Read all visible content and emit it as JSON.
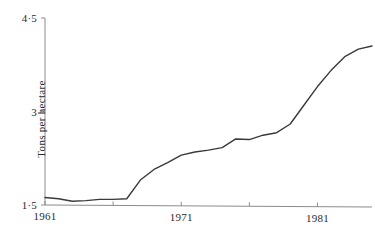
{
  "chart_data": {
    "type": "line",
    "title": "",
    "xlabel": "",
    "ylabel": "Tons per hectare",
    "xlim": [
      1961,
      1985
    ],
    "ylim": [
      1.5,
      4.5
    ],
    "grid": false,
    "legend": null,
    "y_ticks": [
      {
        "value": 4.5,
        "label": "4·5"
      },
      {
        "value": 3.0,
        "label": "3"
      },
      {
        "value": 1.5,
        "label": "1·5"
      }
    ],
    "x_ticks": [
      {
        "value": 1961,
        "label": "1961"
      },
      {
        "value": 1966,
        "label": ""
      },
      {
        "value": 1971,
        "label": "1971"
      },
      {
        "value": 1976,
        "label": ""
      },
      {
        "value": 1981,
        "label": "1981"
      }
    ],
    "series": [
      {
        "name": "Yield",
        "color": "#3a3a3a",
        "x": [
          1961,
          1962,
          1963,
          1964,
          1965,
          1966,
          1967,
          1968,
          1969,
          1970,
          1971,
          1972,
          1973,
          1974,
          1975,
          1976,
          1977,
          1978,
          1979,
          1980,
          1981,
          1982,
          1983,
          1984,
          1985
        ],
        "values": [
          1.62,
          1.6,
          1.56,
          1.57,
          1.59,
          1.59,
          1.6,
          1.9,
          2.07,
          2.18,
          2.3,
          2.35,
          2.38,
          2.42,
          2.56,
          2.55,
          2.62,
          2.66,
          2.8,
          3.1,
          3.4,
          3.66,
          3.88,
          4.0,
          4.05
        ]
      }
    ]
  },
  "axis_style": {
    "axis_color": "#8c8c8c",
    "line_color": "#3a3a3a",
    "text_color": "#2b2b2b"
  }
}
